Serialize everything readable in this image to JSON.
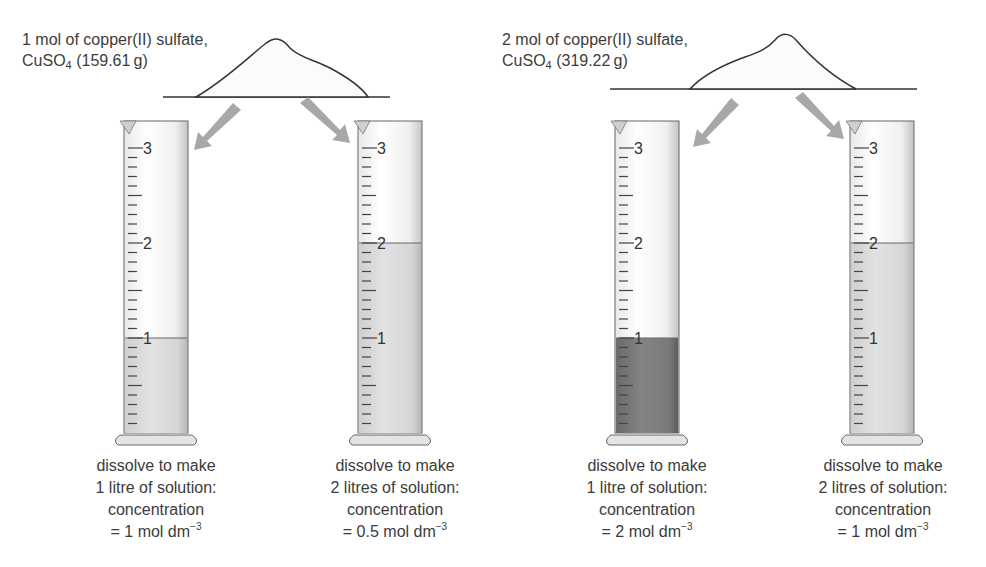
{
  "panels": [
    {
      "id": "left",
      "sample": {
        "line1": "1 mol of copper(II) sulfate,",
        "formula_main": "CuSO",
        "formula_sub": "4",
        "mass": " (159.61 g)"
      },
      "cylinders": [
        {
          "scale": [
            "3",
            "2",
            "1"
          ],
          "fill_level_litres": 1,
          "fill_color": "#d2d2d2",
          "caption": {
            "line1": "dissolve to make",
            "line2": "1 litre of solution:",
            "line3": "concentration",
            "line4": "= 1 mol dm",
            "exp": "−3"
          }
        },
        {
          "scale": [
            "3",
            "2",
            "1"
          ],
          "fill_level_litres": 2,
          "fill_color": "#dedede",
          "caption": {
            "line1": "dissolve to make",
            "line2": "2 litres of solution:",
            "line3": "concentration",
            "line4": "= 0.5 mol dm",
            "exp": "−3"
          }
        }
      ]
    },
    {
      "id": "right",
      "sample": {
        "line1": "2 mol of copper(II) sulfate,",
        "formula_main": "CuSO",
        "formula_sub": "4",
        "mass": " (319.22 g)"
      },
      "cylinders": [
        {
          "scale": [
            "3",
            "2",
            "1"
          ],
          "fill_level_litres": 1,
          "fill_color": "#7a7a7a",
          "caption": {
            "line1": "dissolve to make",
            "line2": "1 litre of solution:",
            "line3": "concentration",
            "line4": "= 2 mol dm",
            "exp": "−3"
          }
        },
        {
          "scale": [
            "3",
            "2",
            "1"
          ],
          "fill_level_litres": 2,
          "fill_color": "#d2d2d2",
          "caption": {
            "line1": "dissolve to make",
            "line2": "2 litres of solution:",
            "line3": "concentration",
            "line4": "= 1 mol dm",
            "exp": "−3"
          }
        }
      ]
    }
  ],
  "colors": {
    "arrow": "#a8a8a8",
    "outline": "#555555",
    "glass": "#f4f4f4",
    "text": "#3c3c3c"
  }
}
